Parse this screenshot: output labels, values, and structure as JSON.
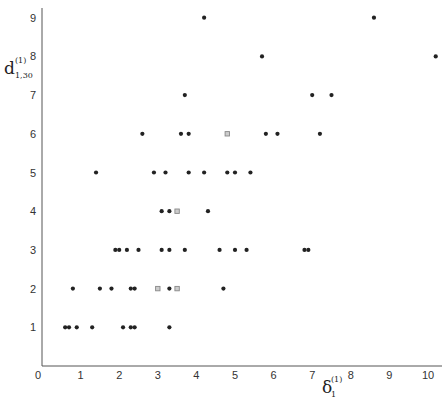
{
  "chart_data": {
    "type": "scatter",
    "title": "",
    "xlabel": "δ₁⁽¹⁾",
    "xlabel_parts": {
      "base": "δ",
      "sup": "(1)",
      "sub": "1"
    },
    "ylabel": "d⁽¹⁾₁,₃₀",
    "ylabel_parts": {
      "base": "d",
      "sup": "(1)",
      "sub": "1,30"
    },
    "xlim": [
      0,
      10.3
    ],
    "ylim": [
      0,
      9.3
    ],
    "grid": false,
    "legend": null,
    "x_ticks": [
      0,
      1,
      2,
      3,
      4,
      5,
      6,
      7,
      8,
      9,
      10
    ],
    "y_ticks": [
      1,
      2,
      3,
      4,
      5,
      6,
      7,
      8,
      9
    ],
    "series": [
      {
        "name": "points",
        "marker": "dot",
        "points": [
          [
            0.6,
            1
          ],
          [
            0.7,
            1
          ],
          [
            0.9,
            1
          ],
          [
            1.3,
            1
          ],
          [
            2.1,
            1
          ],
          [
            2.3,
            1
          ],
          [
            2.4,
            1
          ],
          [
            3.3,
            1
          ],
          [
            0.8,
            2
          ],
          [
            1.5,
            2
          ],
          [
            1.8,
            2
          ],
          [
            2.3,
            2
          ],
          [
            2.4,
            2
          ],
          [
            3.3,
            2
          ],
          [
            4.7,
            2
          ],
          [
            1.9,
            3
          ],
          [
            2.0,
            3
          ],
          [
            2.2,
            3
          ],
          [
            2.5,
            3
          ],
          [
            3.1,
            3
          ],
          [
            3.3,
            3
          ],
          [
            3.7,
            3
          ],
          [
            4.6,
            3
          ],
          [
            5.0,
            3
          ],
          [
            5.3,
            3
          ],
          [
            6.8,
            3
          ],
          [
            6.9,
            3
          ],
          [
            3.1,
            4
          ],
          [
            3.3,
            4
          ],
          [
            4.3,
            4
          ],
          [
            1.4,
            5
          ],
          [
            2.9,
            5
          ],
          [
            3.2,
            5
          ],
          [
            3.8,
            5
          ],
          [
            4.2,
            5
          ],
          [
            4.8,
            5
          ],
          [
            5.0,
            5
          ],
          [
            5.4,
            5
          ],
          [
            2.6,
            6
          ],
          [
            3.6,
            6
          ],
          [
            3.8,
            6
          ],
          [
            5.8,
            6
          ],
          [
            6.1,
            6
          ],
          [
            7.2,
            6
          ],
          [
            3.7,
            7
          ],
          [
            7.0,
            7
          ],
          [
            7.5,
            7
          ],
          [
            5.7,
            8
          ],
          [
            10.2,
            8
          ],
          [
            4.2,
            9
          ],
          [
            8.6,
            9
          ]
        ]
      },
      {
        "name": "open-squares",
        "marker": "square",
        "points": [
          [
            3.0,
            2
          ],
          [
            3.5,
            2
          ],
          [
            3.5,
            4
          ],
          [
            4.8,
            6
          ]
        ]
      }
    ]
  },
  "colors": {
    "point": "#222222",
    "square": "#888888",
    "axis": "#555555"
  }
}
